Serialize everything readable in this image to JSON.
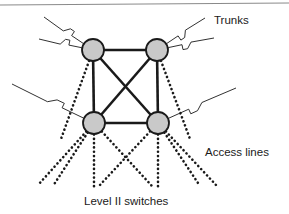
{
  "diagram": {
    "title_visible": false,
    "labels": {
      "trunks": "Trunks",
      "access_lines": "Access lines",
      "level_switches": "Level II switches"
    },
    "colors": {
      "node_fill": "#c9c9c9",
      "node_stroke": "#1a1a1a",
      "trunk_line": "#1a1a1a",
      "solid_link": "#1a1a1a",
      "access_line": "#1a1a1a",
      "background": "#ffffff",
      "top_rule": "#8a8a8a",
      "text": "#1a1a1a"
    },
    "nodes": [
      {
        "id": "sw-top-left",
        "name": "level-ii-switch-top-left",
        "cx": 93,
        "cy": 50,
        "r": 11
      },
      {
        "id": "sw-top-right",
        "name": "level-ii-switch-top-right",
        "cx": 157,
        "cy": 50,
        "r": 11
      },
      {
        "id": "sw-bottom-left",
        "name": "level-ii-switch-bottom-left",
        "cx": 94,
        "cy": 123,
        "r": 11
      },
      {
        "id": "sw-bottom-right",
        "name": "level-ii-switch-bottom-right",
        "cx": 158,
        "cy": 123,
        "r": 11
      }
    ],
    "solid_links": [
      {
        "from": "sw-top-left",
        "to": "sw-top-right",
        "kind": "trunk-link"
      },
      {
        "from": "sw-top-left",
        "to": "sw-bottom-left",
        "kind": "trunk-link"
      },
      {
        "from": "sw-top-right",
        "to": "sw-bottom-right",
        "kind": "trunk-link"
      },
      {
        "from": "sw-bottom-left",
        "to": "sw-bottom-right",
        "kind": "trunk-link"
      },
      {
        "from": "sw-top-left",
        "to": "sw-bottom-right",
        "kind": "trunk-link-diagonal"
      },
      {
        "from": "sw-top-right",
        "to": "sw-bottom-left",
        "kind": "trunk-link-diagonal"
      }
    ],
    "access_lines": [
      {
        "from": "sw-top-left",
        "x2": 61,
        "y2": 139
      },
      {
        "from": "sw-top-right",
        "x2": 190,
        "y2": 139
      },
      {
        "from": "sw-bottom-left",
        "x2": 38,
        "y2": 185
      },
      {
        "from": "sw-bottom-left",
        "x2": 53,
        "y2": 186
      },
      {
        "from": "sw-bottom-left",
        "x2": 94,
        "y2": 187
      },
      {
        "from": "sw-bottom-left",
        "x2": 152,
        "y2": 186
      },
      {
        "from": "sw-bottom-right",
        "x2": 99,
        "y2": 186
      },
      {
        "from": "sw-bottom-right",
        "x2": 158,
        "y2": 187
      },
      {
        "from": "sw-bottom-right",
        "x2": 200,
        "y2": 186
      },
      {
        "from": "sw-bottom-right",
        "x2": 216,
        "y2": 185
      }
    ],
    "trunk_bolts": [
      {
        "name": "trunk-bolt-top-left-upper",
        "from_node": "sw-top-left",
        "tip_x": 44,
        "tip_y": 17
      },
      {
        "name": "trunk-bolt-top-left-lower",
        "from_node": "sw-top-left",
        "tip_x": 39,
        "tip_y": 39
      },
      {
        "name": "trunk-bolt-top-right-upper",
        "from_node": "sw-top-right",
        "tip_x": 205,
        "tip_y": 18
      },
      {
        "name": "trunk-bolt-top-right-lower",
        "from_node": "sw-top-right",
        "tip_x": 214,
        "tip_y": 38
      },
      {
        "name": "trunk-bolt-left-middle",
        "from_node": "sw-bottom-left",
        "tip_x": 12,
        "tip_y": 84
      },
      {
        "name": "trunk-bolt-right-middle",
        "from_node": "sw-bottom-right",
        "tip_x": 236,
        "tip_y": 88
      }
    ],
    "top_rule": {
      "x1": 0,
      "y1": 5,
      "x2": 289,
      "y2": 3
    }
  }
}
